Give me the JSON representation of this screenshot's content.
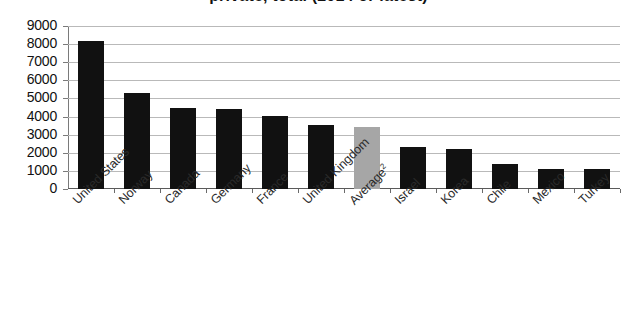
{
  "title": {
    "text_fragment": "private, total (2014 or latest)",
    "clipped": true
  },
  "chart_data": {
    "type": "bar",
    "title": "private, total (2014 or latest)",
    "xlabel": "",
    "ylabel": "",
    "ylim": [
      0,
      9000
    ],
    "ytick_step": 1000,
    "grid": true,
    "legend": "none",
    "categories": [
      "United States",
      "Norway",
      "Canada",
      "Germany",
      "France",
      "United Kingdom",
      "Average²",
      "Israel",
      "Korea",
      "Chile",
      "Mexico",
      "Turkey"
    ],
    "values": [
      8200,
      5300,
      4450,
      4400,
      4050,
      3550,
      3400,
      2300,
      2200,
      1400,
      1100,
      1100
    ],
    "bar_colors": [
      "#111111",
      "#111111",
      "#111111",
      "#111111",
      "#111111",
      "#111111",
      "#a6a6a6",
      "#111111",
      "#111111",
      "#111111",
      "#111111",
      "#111111"
    ],
    "highlight_category": "Average²",
    "highlight_color": "#a6a6a6",
    "series_color": "#111111"
  },
  "axes": {
    "y_ticks": [
      "9000",
      "8000",
      "7000",
      "6000",
      "5000",
      "4000",
      "3000",
      "2000",
      "1000",
      "0"
    ],
    "y_tick_values": [
      9000,
      8000,
      7000,
      6000,
      5000,
      4000,
      3000,
      2000,
      1000,
      0
    ]
  },
  "x_labels": [
    {
      "text": "United States",
      "sup": ""
    },
    {
      "text": "Norway",
      "sup": ""
    },
    {
      "text": "Canada",
      "sup": ""
    },
    {
      "text": "Germany",
      "sup": ""
    },
    {
      "text": "France",
      "sup": ""
    },
    {
      "text": "United Kingdom",
      "sup": ""
    },
    {
      "text": "Average",
      "sup": "2"
    },
    {
      "text": "Israel",
      "sup": ""
    },
    {
      "text": "Korea",
      "sup": ""
    },
    {
      "text": "Chile",
      "sup": ""
    },
    {
      "text": "Mexico",
      "sup": ""
    },
    {
      "text": "Turkey",
      "sup": ""
    }
  ]
}
